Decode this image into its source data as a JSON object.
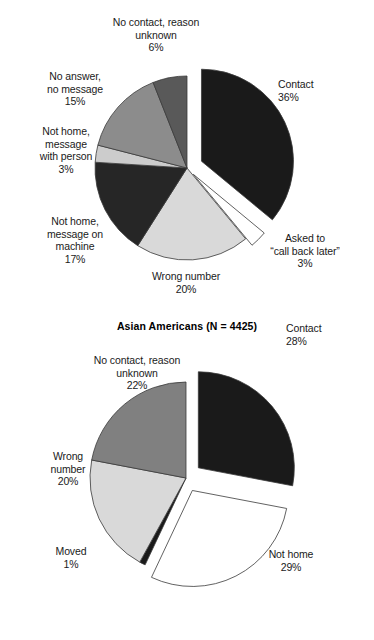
{
  "chart_data": [
    {
      "type": "pie",
      "title": "Asian Americans (N = 4425)",
      "legend": "none",
      "categories": [
        "Contact",
        "Asked to \"call back later\"",
        "Wrong number",
        "Not home, message on machine",
        "Not home, message with person",
        "No answer, no message",
        "No contact, reason unknown"
      ],
      "values": [
        36,
        3,
        20,
        17,
        3,
        15,
        6
      ],
      "value_labels": [
        "36%",
        "3%",
        "20%",
        "17%",
        "3%",
        "15%",
        "6%"
      ],
      "colors": [
        "#1a1a1a",
        "#ffffff",
        "#d9d9d9",
        "#262626",
        "#cccccc",
        "#8c8c8c",
        "#595959"
      ],
      "exploded": [
        "Contact",
        "Asked to \"call back later\""
      ],
      "slices": [
        {
          "label": "Contact",
          "label_line1": "Contact",
          "label_line2": "",
          "pct": "36%",
          "value": 36,
          "color": "#1a1a1a"
        },
        {
          "label": "Asked to call back later",
          "label_line1": "Asked to",
          "label_line2": "“call back later”",
          "pct": "3%",
          "value": 3,
          "color": "#ffffff"
        },
        {
          "label": "Wrong number",
          "label_line1": "Wrong number",
          "label_line2": "",
          "pct": "20%",
          "value": 20,
          "color": "#d9d9d9"
        },
        {
          "label": "Not home, message on machine",
          "label_line1": "Not home,",
          "label_line2": "message on",
          "label_line3": "machine",
          "pct": "17%",
          "value": 17,
          "color": "#262626"
        },
        {
          "label": "Not home, message with person",
          "label_line1": "Not home,",
          "label_line2": "message",
          "label_line3": "with person",
          "pct": "3%",
          "value": 3,
          "color": "#cccccc"
        },
        {
          "label": "No answer, no message",
          "label_line1": "No answer,",
          "label_line2": "no message",
          "pct": "15%",
          "value": 15,
          "color": "#8c8c8c"
        },
        {
          "label": "No contact, reason unknown",
          "label_line1": "No contact, reason",
          "label_line2": "unknown",
          "pct": "6%",
          "value": 6,
          "color": "#595959"
        }
      ]
    },
    {
      "type": "pie",
      "title": "Latinos (N = 35,853)",
      "legend": "none",
      "categories": [
        "Contact",
        "Not home",
        "Moved",
        "Wrong number",
        "No contact, reason unknown"
      ],
      "values": [
        28,
        29,
        1,
        20,
        22
      ],
      "value_labels": [
        "28%",
        "29%",
        "1%",
        "20%",
        "22%"
      ],
      "colors": [
        "#1a1a1a",
        "#ffffff",
        "#1a1a1a",
        "#d9d9d9",
        "#808080"
      ],
      "exploded": [
        "Contact",
        "Not home"
      ],
      "slices": [
        {
          "label": "Contact",
          "label_line1": "Contact",
          "pct": "28%",
          "value": 28,
          "color": "#1a1a1a"
        },
        {
          "label": "Not home",
          "label_line1": "Not home",
          "pct": "29%",
          "value": 29,
          "color": "#ffffff"
        },
        {
          "label": "Moved",
          "label_line1": "Moved",
          "pct": "1%",
          "value": 1,
          "color": "#1a1a1a"
        },
        {
          "label": "Wrong number",
          "label_line1": "Wrong",
          "label_line2": "number",
          "pct": "20%",
          "value": 20,
          "color": "#d9d9d9"
        },
        {
          "label": "No contact, reason unknown",
          "label_line1": "No contact, reason",
          "label_line2": "unknown",
          "pct": "22%",
          "value": 22,
          "color": "#808080"
        }
      ]
    }
  ],
  "fig1": {
    "caption": "Asian Americans (N = 4425)",
    "labels": {
      "unknown": "No contact, reason\nunknown\n6%",
      "noanswer": "No answer,\nno message\n15%",
      "msgperson": "Not home,\nmessage\nwith person\n3%",
      "msgmachine": "Not home,\nmessage on\nmachine\n17%",
      "wrongnum": "Wrong number\n20%",
      "callback": "Asked to\n“call back later”\n3%",
      "contact": "Contact\n36%"
    }
  },
  "fig2": {
    "caption": "Latinos (N = 35,853)",
    "labels": {
      "unknown": "No contact, reason\nunknown\n22%",
      "wrongnum": "Wrong\nnumber\n20%",
      "moved": "Moved\n1%",
      "nothome": "Not home\n29%",
      "contact": "Contact\n28%"
    }
  }
}
